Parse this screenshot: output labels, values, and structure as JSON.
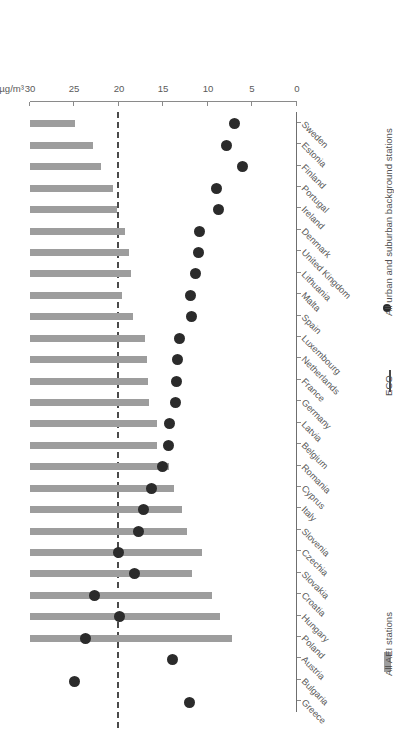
{
  "chart_data": {
    "type": "bar",
    "title": "",
    "xlabel": "µg/m³",
    "ylabel": "",
    "orientation": "horizontal",
    "xlim": [
      0,
      30
    ],
    "xticks": [
      0,
      5,
      10,
      15,
      20,
      25,
      30
    ],
    "xticklabels": [
      "0",
      "5",
      "10",
      "15",
      "20",
      "25",
      "30"
    ],
    "grid": false,
    "legend_position": "bottom-right",
    "annotations": [
      {
        "label": "ECO",
        "value": 20,
        "style": "dashed-vertical-line"
      }
    ],
    "categories": [
      "Sweden",
      "Estonia",
      "Finland",
      "Portugal",
      "Ireland",
      "Denmark",
      "United Kingdom",
      "Lithuania",
      "Malta",
      "Spain",
      "Luxembourg",
      "Netherlands",
      "France",
      "Germany",
      "Latvia",
      "Belgium",
      "Romania",
      "Cyprus",
      "Italy",
      "Slovenia",
      "Czechia",
      "Slovakia",
      "Croatia",
      "Hungary",
      "Poland",
      "Austria",
      "Bulgaria",
      "Greece"
    ],
    "series": [
      {
        "name": "All AEI stations",
        "type": "bar",
        "color": "#9d9d9d",
        "values": [
          5.1,
          7.1,
          8.0,
          9.3,
          9.8,
          10.7,
          11.1,
          11.4,
          10.3,
          11.6,
          12.9,
          13.2,
          13.3,
          13.4,
          14.3,
          14.3,
          15.6,
          16.2,
          17.1,
          17.6,
          19.3,
          18.2,
          20.4,
          21.3,
          22.7,
          null,
          null,
          null
        ]
      },
      {
        "name": "All urban and suburban background stations",
        "type": "scatter",
        "color": "#2b2b2b",
        "values": [
          7.0,
          7.9,
          6.1,
          9.0,
          8.8,
          11.0,
          11.1,
          11.4,
          12.0,
          11.8,
          13.2,
          13.4,
          13.5,
          13.6,
          14.3,
          14.4,
          15.1,
          16.3,
          17.2,
          17.8,
          20.0,
          18.3,
          22.7,
          19.9,
          23.8,
          14.0,
          25.0,
          12.1
        ]
      }
    ],
    "legend": [
      {
        "label": "All AEI stations",
        "marker": "bar",
        "color": "#9d9d9d"
      },
      {
        "label": "ECO",
        "marker": "line",
        "color": "#4a4a4a"
      },
      {
        "label": "All urban and suburban background stations",
        "marker": "dot",
        "color": "#2b2b2b"
      }
    ]
  }
}
